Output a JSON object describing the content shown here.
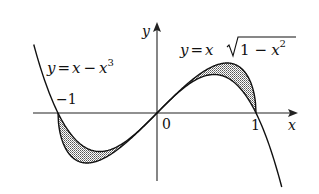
{
  "diagram": {
    "type": "function-plot",
    "axes": {
      "x_label": "x",
      "y_label": "y",
      "origin_label": "0",
      "tick_labels": [
        "-1",
        "1"
      ]
    },
    "curves": [
      {
        "id": "cubic",
        "equation_prefix": "y = x − x",
        "equation_sup": "3",
        "formula": "y = x - x^3"
      },
      {
        "id": "root",
        "equation_prefix": "y = x",
        "equation_radicand": "1 − x",
        "equation_sup": "2",
        "formula": "y = x*sqrt(1 - x^2)"
      }
    ],
    "shaded_regions": [
      {
        "between": [
          "cubic",
          "root"
        ],
        "interval": [
          -1,
          0
        ],
        "fill": "stippled gray"
      },
      {
        "between": [
          "cubic",
          "root"
        ],
        "interval": [
          0,
          1
        ],
        "fill": "stippled gray"
      }
    ],
    "colors": {
      "stroke": "#111111",
      "shade": "#a8a8a8",
      "background": "#ffffff"
    }
  },
  "labels": {
    "x_axis": "x",
    "y_axis": "y",
    "origin": "0",
    "neg_one": "−1",
    "pos_one": "1",
    "cubic_lhs": "y",
    "cubic_eq": "=",
    "cubic_x": "x",
    "cubic_minus": "−",
    "cubic_x2": "x",
    "cubic_pow": "3",
    "root_lhs": "y",
    "root_eq": "=",
    "root_x": "x",
    "root_one": "1",
    "root_minus": "−",
    "root_x2": "x",
    "root_pow": "2"
  }
}
